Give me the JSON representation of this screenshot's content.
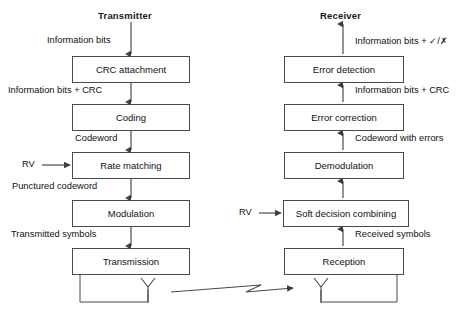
{
  "diagram": {
    "title_transmitter": "Transmitter",
    "title_receiver": "Receiver",
    "rv_label_tx": "RV",
    "rv_label_rx": "RV"
  },
  "transmitter": {
    "blocks": [
      {
        "id": "crc-attachment",
        "label": "CRC attachment"
      },
      {
        "id": "coding",
        "label": "Coding"
      },
      {
        "id": "rate-matching",
        "label": "Rate matching"
      },
      {
        "id": "modulation",
        "label": "Modulation"
      },
      {
        "id": "transmission",
        "label": "Transmission"
      }
    ],
    "edge_labels": [
      {
        "id": "tx-edge-0",
        "label": "Information bits"
      },
      {
        "id": "tx-edge-1",
        "label": "Information bits + CRC"
      },
      {
        "id": "tx-edge-2",
        "label": "Codeword"
      },
      {
        "id": "tx-edge-3",
        "label": "Punctured codeword"
      },
      {
        "id": "tx-edge-4",
        "label": "Transmitted symbols"
      }
    ]
  },
  "receiver": {
    "blocks": [
      {
        "id": "error-detection",
        "label": "Error detection"
      },
      {
        "id": "error-correction",
        "label": "Error correction"
      },
      {
        "id": "demodulation",
        "label": "Demodulation"
      },
      {
        "id": "soft-decision-combining",
        "label": "Soft decision combining"
      },
      {
        "id": "reception",
        "label": "Reception"
      }
    ],
    "edge_labels": [
      {
        "id": "rx-edge-0",
        "label": "Information bits + ✓/✗"
      },
      {
        "id": "rx-edge-1",
        "label": "Information bits + CRC"
      },
      {
        "id": "rx-edge-2",
        "label": "Codeword with errors"
      },
      {
        "id": "rx-edge-3",
        "label": "Received symbols"
      }
    ]
  },
  "channel": {
    "icon_tx_antenna": "antenna-icon",
    "icon_rx_antenna": "antenna-icon",
    "icon_link": "wireless-link-icon"
  },
  "colors": {
    "box_border": "#4a4a4a",
    "line": "#3d3d3d",
    "text": "#111111",
    "background": "#ffffff"
  }
}
